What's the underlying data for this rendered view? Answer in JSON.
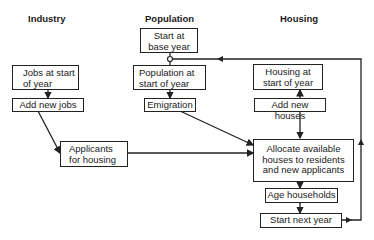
{
  "columns": {
    "industry": "Industry",
    "population": "Population",
    "housing": "Housing"
  },
  "boxes": {
    "start_base_year": "Start at\nbase year",
    "jobs_start": "Jobs at start\nof year",
    "add_new_jobs": "Add new jobs",
    "population_start": "Population at\nstart of year",
    "emigration": "Emigration",
    "housing_start": "Housing at\nstart of year",
    "add_new_houses": "Add new houses",
    "applicants": "Applicants\nfor housing",
    "allocate": "Allocate available\nhouses to residents\nand new applicants",
    "age_households": "Age households",
    "start_next_year": "Start next year"
  },
  "colors": {
    "line": "#222222",
    "background": "#ffffff"
  }
}
